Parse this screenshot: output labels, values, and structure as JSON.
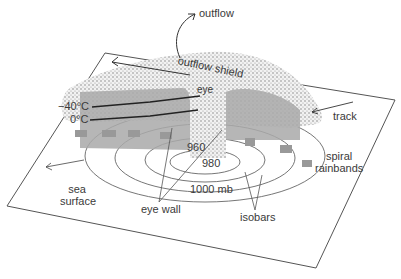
{
  "diagram": {
    "labels": {
      "outflow": "outflow",
      "outflow_shield": "outflow shield",
      "eye": "eye",
      "temp_minus40": "−40°C",
      "temp_0": "0°C",
      "track": "track",
      "isobar_960": "960",
      "isobar_980": "980",
      "isobar_1000": "1000 mb",
      "spiral_rainbands_line1": "spiral",
      "spiral_rainbands_line2": "rainbands",
      "sea_line1": "sea",
      "sea_line2": "surface",
      "eye_wall": "eye wall",
      "isobars": "isobars"
    },
    "colors": {
      "cloud_stipple": "#8a8a8a",
      "cloud_gray": "#a9a9a9",
      "line": "#555555",
      "background": "#ffffff"
    }
  }
}
